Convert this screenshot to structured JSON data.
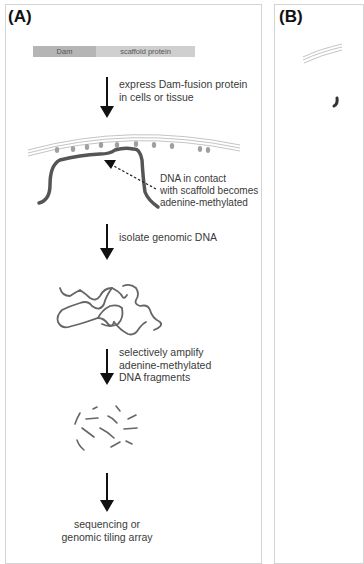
{
  "panels": [
    {
      "label": "(A)",
      "fusion_protein": {
        "segments": [
          "Dam",
          "scaffold protein"
        ]
      },
      "steps": [
        {
          "text": "express Dam-fusion protein\nin cells or tissue"
        },
        {
          "text": "isolate genomic DNA"
        },
        {
          "text": "selectively amplify\nadenine-methylated\nDNA fragments"
        },
        {
          "text": "sequencing or\ngenomic tiling array"
        }
      ],
      "annotation": "DNA in contact\nwith scaffold becomes\nadenine-methylated"
    },
    {
      "label": "(B)"
    }
  ],
  "colors": {
    "dna": "#555555",
    "scaffold_lines": "#bdbdbd",
    "dam_dots": "#9a9a9a",
    "arrow": "#111111"
  }
}
